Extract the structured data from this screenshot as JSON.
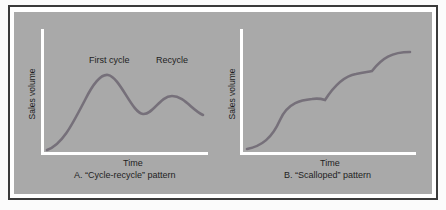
{
  "panels": [
    {
      "id": "A",
      "y_axis_label": "Sales volume",
      "x_axis_label": "Time",
      "caption": "A.  “Cycle-recycle” pattern",
      "annotations": [
        "First cycle",
        "Recycle"
      ]
    },
    {
      "id": "B",
      "y_axis_label": "Sales volume",
      "x_axis_label": "Time",
      "caption": "B.  “Scalloped” pattern"
    }
  ],
  "colors": {
    "curve": "#76707a",
    "background": "#a9a9a9",
    "axis": "#ffffff",
    "frame": "#3a3a3a"
  }
}
